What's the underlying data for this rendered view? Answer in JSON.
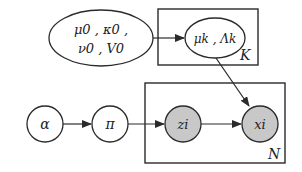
{
  "diagram": {
    "colors": {
      "stroke": "#2a2a2a",
      "observed_fill": "#c8c8c8",
      "latent_fill": "#ffffff"
    },
    "nodes": [
      {
        "id": "hyper",
        "line1": "μ0 , κ0 ,",
        "line2": "ν0 , V0",
        "shape": "ellipse"
      },
      {
        "id": "mu_lambda",
        "label": "μk , Λk",
        "shape": "ellipse"
      },
      {
        "id": "alpha",
        "label": "α",
        "shape": "circle"
      },
      {
        "id": "pi",
        "label": "π",
        "shape": "circle"
      },
      {
        "id": "z",
        "label": "zi",
        "shape": "circle",
        "shaded": true
      },
      {
        "id": "x",
        "label": "xi",
        "shape": "circle",
        "shaded": true
      }
    ],
    "plates": [
      {
        "id": "K",
        "label": "K"
      },
      {
        "id": "N",
        "label": "N"
      }
    ],
    "edges": [
      {
        "from": "hyper",
        "to": "mu_lambda"
      },
      {
        "from": "mu_lambda",
        "to": "x"
      },
      {
        "from": "alpha",
        "to": "pi"
      },
      {
        "from": "pi",
        "to": "z"
      },
      {
        "from": "z",
        "to": "x"
      }
    ]
  }
}
